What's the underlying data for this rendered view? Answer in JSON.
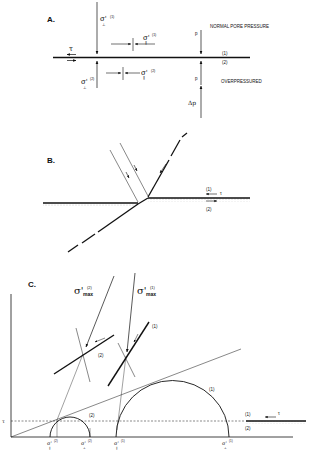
{
  "figure": {
    "panels": [
      {
        "id": "A",
        "label": "A.",
        "top_text": "NORMAL PORE PRESSURE",
        "bottom_text": "OVERPRESSURED",
        "layer_top": "(1)",
        "layer_bottom": "(2)",
        "tau": "τ",
        "sigma_perp_1": "σ'⊥(1)",
        "sigma_perp_2": "σ'⊥(2)",
        "sigma_par_1": "σ'∥(1)",
        "sigma_par_2": "σ'∥(2)",
        "sig_sym": "σ'",
        "sup1": "(1)",
        "sup2": "(2)",
        "sub_perp": "⊥",
        "sub_par": "∥",
        "p_top": "p",
        "p_bottom": "p",
        "delta_p": "Δp"
      },
      {
        "id": "B",
        "label": "B.",
        "layer_top": "(1)",
        "layer_bottom": "(2)",
        "tau": "τ"
      },
      {
        "id": "C",
        "label": "C.",
        "sigma_max_2": "σ'max(2)",
        "sigma_max_1": "σ'max(1)",
        "sig_sym": "σ'",
        "max_sub": "max",
        "sup1": "(1)",
        "sup2": "(2)",
        "fault_label_1": "(1)",
        "fault_label_2": "(2)",
        "circle_label_1": "(1)",
        "circle_label_2": "(2)",
        "tau_axis": "τ",
        "inset_top": "(1)",
        "inset_bottom": "(2)",
        "inset_tau": "τ",
        "axis_labels": [
          "σ'∥(2)",
          "σ'⊥(2)",
          "σ'∥(1)",
          "σ'⊥(1)"
        ]
      }
    ]
  }
}
